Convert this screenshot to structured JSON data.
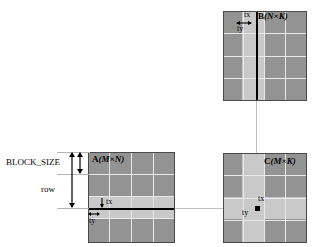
{
  "diagram": {
    "colors": {
      "matrix_fill": "#939393",
      "band_fill": "#c9c9c9",
      "gridline": "#e8e8e8",
      "border": "#4a4a4a",
      "marker": "#000000",
      "leader": "#b4b4b4",
      "connector": "#c0c0c0",
      "background": "#ffffff"
    },
    "matrices": [
      {
        "id": "a",
        "name": "A",
        "dims": "(M×N)",
        "label": "A(M×N)",
        "grid_cols": 4,
        "grid_rows": 4
      },
      {
        "id": "b",
        "name": "B",
        "dims": "(N×K)",
        "label": "B(N×K)",
        "grid_cols": 4,
        "grid_rows": 4
      },
      {
        "id": "c",
        "name": "C",
        "dims": "(M×K)",
        "label": "C(M×K)",
        "grid_cols": 4,
        "grid_rows": 4
      }
    ],
    "annotations": {
      "block_size": "BLOCK_SIZE",
      "row": "row",
      "a_tx": "tx",
      "a_ty": "ty",
      "b_tx": "tx",
      "b_ty": "ty",
      "c_tx": "tx",
      "c_ty": "ty"
    }
  }
}
